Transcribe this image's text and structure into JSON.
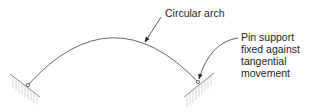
{
  "diagram": {
    "labels": {
      "arch": "Circular arch",
      "pin_lines": [
        "Pin support",
        "fixed against",
        "tangential",
        "movement"
      ]
    },
    "elements": {
      "arch": {
        "type": "circular-arc",
        "start": [
          28,
          85
        ],
        "apex": [
          112,
          38
        ],
        "end": [
          198,
          82
        ]
      },
      "left_support": {
        "type": "pin-support",
        "position": [
          28,
          85
        ],
        "ground_line": [
          [
            10,
            74
          ],
          [
            40,
            97
          ]
        ]
      },
      "right_support": {
        "type": "pin-support",
        "position": [
          198,
          82
        ],
        "ground_line": [
          [
            184,
            97
          ],
          [
            214,
            73
          ]
        ]
      }
    },
    "colors": {
      "line": "#555555",
      "hatch": "#bbbbbb",
      "text": "#222222"
    }
  }
}
